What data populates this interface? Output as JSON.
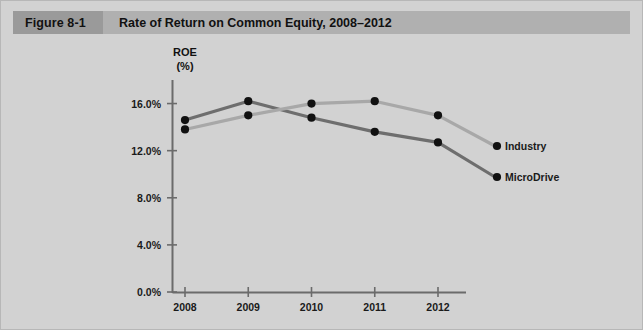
{
  "figure": {
    "number": "Figure 8-1",
    "title": "Rate of Return on Common Equity, 2008–2012"
  },
  "colors": {
    "page_background": "#d2d2d2",
    "header_band": "#b0b0b0",
    "figure_number_block": "#9a9a9a",
    "axis": "#6b6b6b",
    "microdrive_line": "#6e6e6e",
    "industry_line": "#a8a8a8",
    "marker": "#111111"
  },
  "chart_data": {
    "type": "line",
    "title": "Rate of Return on Common Equity, 2008–2012",
    "xlabel": "",
    "ylabel": "ROE (%)",
    "ylabel_lines": [
      "ROE",
      "(%)"
    ],
    "categories": [
      "2008",
      "2009",
      "2010",
      "2011",
      "2012"
    ],
    "x": [
      2008,
      2009,
      2010,
      2011,
      2012
    ],
    "ylim": [
      0.0,
      18.0
    ],
    "yticks": [
      0.0,
      4.0,
      8.0,
      12.0,
      16.0
    ],
    "ytick_labels": [
      "0.0%",
      "4.0%",
      "8.0%",
      "12.0%",
      "16.0%"
    ],
    "xtick_labels": [
      "2008",
      "2009",
      "2010",
      "2011",
      "2012"
    ],
    "grid": false,
    "legend": "inline-end-of-line-labels",
    "series": [
      {
        "name": "MicroDrive",
        "color": "#6e6e6e",
        "values": [
          14.6,
          16.2,
          14.8,
          13.6,
          12.7
        ]
      },
      {
        "name": "Industry",
        "color": "#a8a8a8",
        "values": [
          13.8,
          15.0,
          16.0,
          16.2,
          15.0
        ]
      }
    ]
  }
}
